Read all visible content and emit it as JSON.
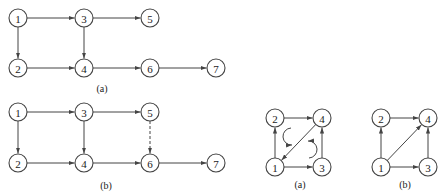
{
  "figures": [
    {
      "id": "graph-a-left",
      "caption": "(a)",
      "caption_pos": [
        102,
        88
      ],
      "nodes": [
        {
          "label": "1",
          "x": 18,
          "y": 18
        },
        {
          "label": "3",
          "x": 84,
          "y": 18
        },
        {
          "label": "5",
          "x": 150,
          "y": 18
        },
        {
          "label": "2",
          "x": 18,
          "y": 68
        },
        {
          "label": "4",
          "x": 84,
          "y": 68
        },
        {
          "label": "6",
          "x": 150,
          "y": 68
        },
        {
          "label": "7",
          "x": 216,
          "y": 68
        }
      ],
      "edges": [
        {
          "from": "1",
          "to": "3",
          "style": "solid"
        },
        {
          "from": "3",
          "to": "5",
          "style": "solid"
        },
        {
          "from": "1",
          "to": "2",
          "style": "solid"
        },
        {
          "from": "3",
          "to": "4",
          "style": "solid"
        },
        {
          "from": "2",
          "to": "4",
          "style": "solid"
        },
        {
          "from": "4",
          "to": "6",
          "style": "solid"
        },
        {
          "from": "6",
          "to": "7",
          "style": "solid"
        }
      ]
    },
    {
      "id": "graph-b-left",
      "caption": "(b)",
      "caption_pos": [
        106,
        185
      ],
      "nodes": [
        {
          "label": "1",
          "x": 18,
          "y": 112
        },
        {
          "label": "3",
          "x": 84,
          "y": 112
        },
        {
          "label": "5",
          "x": 150,
          "y": 112
        },
        {
          "label": "2",
          "x": 18,
          "y": 163
        },
        {
          "label": "4",
          "x": 84,
          "y": 163
        },
        {
          "label": "6",
          "x": 150,
          "y": 163
        },
        {
          "label": "7",
          "x": 216,
          "y": 163
        }
      ],
      "edges": [
        {
          "from": "1",
          "to": "3",
          "style": "solid"
        },
        {
          "from": "3",
          "to": "5",
          "style": "solid"
        },
        {
          "from": "1",
          "to": "2",
          "style": "solid"
        },
        {
          "from": "3",
          "to": "4",
          "style": "solid"
        },
        {
          "from": "5",
          "to": "6",
          "style": "dashed"
        },
        {
          "from": "2",
          "to": "4",
          "style": "solid"
        },
        {
          "from": "4",
          "to": "6",
          "style": "solid"
        },
        {
          "from": "6",
          "to": "7",
          "style": "solid"
        }
      ]
    },
    {
      "id": "graph-a-right",
      "caption": "(a)",
      "caption_pos": [
        300,
        184
      ],
      "nodes": [
        {
          "label": "2",
          "x": 275,
          "y": 118
        },
        {
          "label": "4",
          "x": 322,
          "y": 118
        },
        {
          "label": "1",
          "x": 275,
          "y": 167
        },
        {
          "label": "3",
          "x": 322,
          "y": 167
        }
      ],
      "edges": [
        {
          "from": "1",
          "to": "2",
          "style": "solid"
        },
        {
          "from": "2",
          "to": "4",
          "style": "solid"
        },
        {
          "from": "4",
          "to": "1",
          "style": "solid"
        },
        {
          "from": "1",
          "to": "3",
          "style": "solid"
        },
        {
          "from": "3",
          "to": "4",
          "style": "solid"
        }
      ],
      "cycle_marks": [
        "clockwise-upper-left",
        "clockwise-lower-right"
      ]
    },
    {
      "id": "graph-b-right",
      "caption": "(b)",
      "caption_pos": [
        405,
        184
      ],
      "nodes": [
        {
          "label": "2",
          "x": 381,
          "y": 118
        },
        {
          "label": "4",
          "x": 428,
          "y": 118
        },
        {
          "label": "1",
          "x": 381,
          "y": 167
        },
        {
          "label": "3",
          "x": 428,
          "y": 167
        }
      ],
      "edges": [
        {
          "from": "1",
          "to": "2",
          "style": "solid"
        },
        {
          "from": "2",
          "to": "4",
          "style": "solid"
        },
        {
          "from": "1",
          "to": "4",
          "style": "solid"
        },
        {
          "from": "1",
          "to": "3",
          "style": "solid"
        },
        {
          "from": "3",
          "to": "4",
          "style": "solid"
        }
      ]
    }
  ],
  "style": {
    "node_radius": 9,
    "stroke": "#444444",
    "background": "#ffffff"
  }
}
